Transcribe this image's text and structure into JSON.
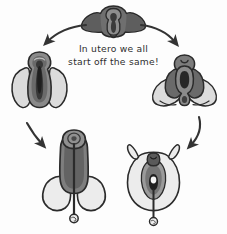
{
  "figure": {
    "background_color": "#fdfdfd",
    "caption": {
      "line1": "In utero we all",
      "line2": "start off the same!"
    },
    "palette": {
      "outline": "#2b2b2b",
      "dark_gray": "#4a4a4a",
      "mid_gray": "#6f6f6f",
      "light_gray": "#d9d9d9",
      "pale_gray": "#ececec",
      "arrow": "#333333",
      "text": "#2e2e2e"
    },
    "stages": [
      {
        "id": "undifferentiated",
        "label": "Undifferentiated genital tubercle",
        "position": "top-center"
      },
      {
        "id": "male-early",
        "label": "Early male differentiation",
        "position": "left-middle"
      },
      {
        "id": "female-early",
        "label": "Early female differentiation",
        "position": "right-middle"
      },
      {
        "id": "male-final",
        "label": "Penis and scrotum",
        "position": "bottom-left"
      },
      {
        "id": "female-final",
        "label": "Vulva and labia",
        "position": "bottom-right"
      }
    ],
    "arrows": [
      {
        "id": "arrow-top-left",
        "from": "undifferentiated",
        "to": "male-early",
        "direction": "down-left"
      },
      {
        "id": "arrow-top-right",
        "from": "undifferentiated",
        "to": "female-early",
        "direction": "down-right"
      },
      {
        "id": "arrow-bottom-left",
        "from": "male-early",
        "to": "male-final",
        "direction": "down-right"
      },
      {
        "id": "arrow-bottom-right",
        "from": "female-early",
        "to": "female-final",
        "direction": "down-left"
      }
    ]
  }
}
